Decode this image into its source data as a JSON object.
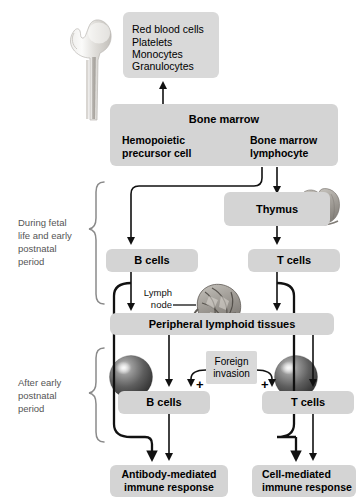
{
  "diagram": {
    "colors": {
      "box_fill": "#d4d4d4",
      "box_fill_light": "#d9d9d9",
      "line": "#111111",
      "bracket_label": "#555555",
      "background": "#ffffff"
    },
    "blood_cells_box": {
      "lines": [
        "Red blood cells",
        "Platelets",
        "Monocytes",
        "Granulocytes"
      ]
    },
    "bone_marrow": {
      "title": "Bone marrow",
      "precursor": "Hemopoietic\nprecursor cell",
      "precursor_line1": "Hemopoietic",
      "precursor_line2": "precursor cell",
      "lymphocyte_line1": "Bone marrow",
      "lymphocyte_line2": "lymphocyte"
    },
    "thymus_box": {
      "label": "Thymus"
    },
    "stage1": {
      "b_cells": "B cells",
      "t_cells": "T cells"
    },
    "lymph_node": {
      "line1": "Lymph",
      "line2": "node"
    },
    "peripheral": {
      "label": "Peripheral lymphoid tissues"
    },
    "foreign": {
      "line1": "Foreign",
      "line2": "invasion",
      "plus_left": "+",
      "plus_right": "+"
    },
    "stage2": {
      "b_cells": "B cells",
      "t_cells": "T cells"
    },
    "outcomes": {
      "antibody_line1": "Antibody-mediated",
      "antibody_line2": "immune response",
      "cell_line1": "Cell-mediated",
      "cell_line2": "immune response"
    },
    "brackets": {
      "upper": "During fetal\nlife and early\npostnatal\nperiod",
      "upper_l1": "During fetal",
      "upper_l2": "life and early",
      "upper_l3": "postnatal",
      "upper_l4": "period",
      "lower_l1": "After early",
      "lower_l2": "postnatal",
      "lower_l3": "period"
    },
    "illustrations": {
      "bone": "femur-bone-illustration",
      "thymus": "thymus-organ-illustration",
      "lymph_node": "lymph-node-illustration",
      "b_lymphocyte": "b-lymphocyte-cell-sphere",
      "t_lymphocyte": "t-lymphocyte-cell-sphere"
    }
  }
}
